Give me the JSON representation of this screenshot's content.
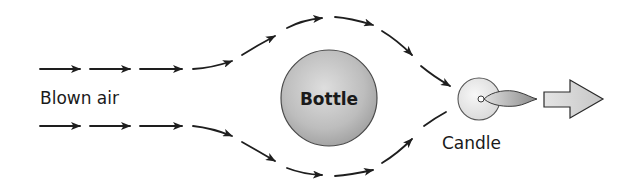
{
  "diagram": {
    "labels": {
      "blown_air": "Blown air",
      "bottle": "Bottle",
      "candle": "Candle"
    },
    "colors": {
      "stroke": "#1e1e1e",
      "bottle_fill_light": "#dcdcdc",
      "bottle_fill_dark": "#a8a8a8",
      "candle_fill": "#ececec",
      "flame_light": "#d8d8d8",
      "flame_dark": "#8c8c8c",
      "arrow_fill": "#d0d0d0"
    },
    "flows": [
      {
        "name": "upper-stream",
        "direction": "right",
        "path": "above bottle"
      },
      {
        "name": "lower-stream",
        "direction": "right",
        "path": "below bottle"
      }
    ]
  }
}
